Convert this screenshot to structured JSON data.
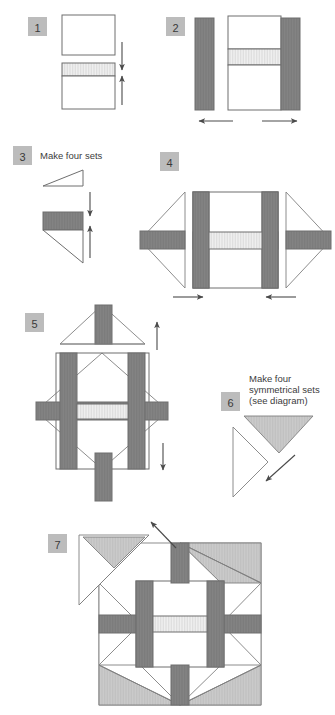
{
  "page": {
    "width": 335,
    "height": 715,
    "background": "#ffffff"
  },
  "colors": {
    "dark_fabric": "#808080",
    "light_hatch_fabric": "#e9e9e9",
    "medium_fabric": "#c9c9c9",
    "background_fabric": "#ffffff",
    "outline": "#6e6e6e",
    "badge_background": "#bcbcbc",
    "badge_text": "#3a3a3a",
    "caption_text": "#3c3c3c",
    "arrow": "#4a4a4a"
  },
  "steps": [
    {
      "number": "1",
      "caption": "",
      "badge_x": 28,
      "badge_y": 17,
      "description": "Two squares: plain white square above, square with light hatched strip across top below. Double arrow indicates seam direction."
    },
    {
      "number": "2",
      "caption": "",
      "badge_x": 166,
      "badge_y": 17,
      "description": "Center unit with light hatched center strip flanked by two dark vertical bars. Arrows point outward left and right."
    },
    {
      "number": "3",
      "caption": "Make four sets",
      "badge_x": 13,
      "badge_y": 146,
      "description": "White triangle above, dark bar with triangle below. Double arrow indicates seam direction."
    },
    {
      "number": "4",
      "caption": "",
      "badge_x": 160,
      "badge_y": 152,
      "description": "Center block with dark vertical bars and light hatched horizontal center strip, with side triangle units attached bearing dark horizontal bars. Arrows point inward."
    },
    {
      "number": "5",
      "caption": "",
      "badge_x": 25,
      "badge_y": 313,
      "description": "On-point block with dark cross bars, light hatched center, and triangle unit above with dark vertical bar. Arrows up and down."
    },
    {
      "number": "6",
      "caption": "Make four\nsymmetrical sets\n(see diagram)",
      "caption_lines": [
        "Make four",
        "symmetrical sets",
        "(see diagram)"
      ],
      "badge_x": 221,
      "badge_y": 392,
      "description": "Medium gray triangle joining a white triangle, arrow pointing down-left."
    },
    {
      "number": "7",
      "caption": "",
      "badge_x": 48,
      "badge_y": 534,
      "description": "Final assembled block: square block with medium gray corner triangles, dark cross bars, light hatched center, and one detached corner unit at top left with arrow."
    }
  ],
  "icons": {
    "arrow_down": "arrow-down-icon",
    "arrow_up": "arrow-up-icon",
    "arrow_left": "arrow-left-icon",
    "arrow_right": "arrow-right-icon",
    "arrow_diagonal": "arrow-diagonal-icon"
  }
}
